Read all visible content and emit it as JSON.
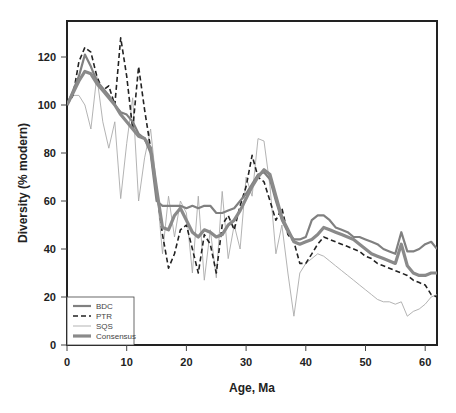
{
  "chart_data": {
    "type": "line",
    "title": "",
    "xlabel": "Age, Ma",
    "ylabel": "Diversity (% modern)",
    "xlim": [
      0,
      62
    ],
    "ylim": [
      0,
      135
    ],
    "xticks": [
      0,
      10,
      20,
      30,
      40,
      50,
      60
    ],
    "yticks": [
      0,
      20,
      40,
      60,
      80,
      100,
      120
    ],
    "grid": false,
    "legend_position": "lower left",
    "series": [
      {
        "name": "BDC",
        "style": "solid-medium",
        "color": "#808080",
        "x": [
          0,
          1,
          2,
          3,
          4,
          5,
          6,
          7,
          8,
          9,
          10,
          11,
          12,
          13,
          14,
          15,
          16,
          17,
          18,
          19,
          20,
          21,
          22,
          23,
          24,
          25,
          26,
          27,
          28,
          29,
          30,
          31,
          32,
          33,
          34,
          35,
          36,
          37,
          38,
          39,
          40,
          41,
          42,
          43,
          44,
          45,
          46,
          47,
          48,
          49,
          50,
          51,
          52,
          53,
          54,
          55,
          56,
          57,
          58,
          59,
          60,
          61,
          62
        ],
        "y": [
          100,
          106,
          112,
          121,
          116,
          110,
          107,
          104,
          100,
          97,
          96,
          93,
          88,
          86,
          80,
          60,
          58,
          58,
          58,
          58,
          57,
          58,
          57,
          58,
          58,
          55,
          55,
          56,
          57,
          60,
          63,
          67,
          71,
          72,
          69,
          60,
          52,
          47,
          44,
          44,
          45,
          52,
          54,
          54,
          52,
          49,
          48,
          47,
          45,
          45,
          44,
          43,
          42,
          40,
          39,
          38,
          47,
          39,
          39,
          40,
          42,
          43,
          40
        ]
      },
      {
        "name": "PTR",
        "style": "dashed",
        "color": "#222222",
        "x": [
          0,
          1,
          2,
          3,
          4,
          5,
          6,
          7,
          8,
          9,
          10,
          11,
          12,
          13,
          14,
          15,
          16,
          17,
          18,
          19,
          20,
          21,
          22,
          23,
          24,
          25,
          26,
          27,
          28,
          29,
          30,
          31,
          32,
          33,
          34,
          35,
          36,
          37,
          38,
          39,
          40,
          41,
          42,
          43,
          44,
          45,
          46,
          47,
          48,
          49,
          50,
          51,
          52,
          53,
          54,
          55,
          56,
          57,
          58,
          59,
          60,
          61,
          62
        ],
        "y": [
          100,
          104,
          118,
          124,
          122,
          112,
          106,
          108,
          100,
          128,
          112,
          90,
          116,
          98,
          82,
          65,
          46,
          32,
          38,
          48,
          50,
          40,
          30,
          46,
          42,
          30,
          50,
          54,
          48,
          58,
          66,
          79,
          70,
          68,
          60,
          52,
          57,
          46,
          43,
          34,
          34,
          38,
          42,
          45,
          44,
          43,
          42,
          41,
          40,
          39,
          37,
          36,
          34,
          33,
          32,
          31,
          30,
          29,
          27,
          26,
          25,
          21,
          20
        ]
      },
      {
        "name": "SQS",
        "style": "solid-thin",
        "color": "#aaaaaa",
        "x": [
          0,
          1,
          2,
          3,
          4,
          5,
          6,
          7,
          8,
          9,
          10,
          11,
          12,
          13,
          14,
          15,
          16,
          17,
          18,
          19,
          20,
          21,
          22,
          23,
          24,
          25,
          26,
          27,
          28,
          29,
          30,
          31,
          32,
          33,
          34,
          35,
          36,
          37,
          38,
          39,
          40,
          41,
          42,
          43,
          44,
          45,
          46,
          47,
          48,
          49,
          50,
          51,
          52,
          53,
          54,
          55,
          56,
          57,
          58,
          59,
          60,
          61,
          62
        ],
        "y": [
          100,
          104,
          104,
          100,
          90,
          112,
          93,
          82,
          93,
          61,
          84,
          103,
          60,
          78,
          90,
          66,
          38,
          62,
          45,
          60,
          55,
          30,
          62,
          27,
          48,
          28,
          64,
          36,
          50,
          40,
          70,
          62,
          86,
          85,
          66,
          38,
          50,
          30,
          12,
          30,
          34,
          36,
          38,
          37,
          35,
          33,
          31,
          29,
          27,
          25,
          23,
          21,
          19,
          18,
          18,
          17,
          18,
          12,
          14,
          15,
          17,
          20,
          21
        ]
      },
      {
        "name": "Consensus",
        "style": "solid-thick",
        "color": "#8a8a8a",
        "x": [
          0,
          1,
          2,
          3,
          4,
          5,
          6,
          7,
          8,
          9,
          10,
          11,
          12,
          13,
          14,
          15,
          16,
          17,
          18,
          19,
          20,
          21,
          22,
          23,
          24,
          25,
          26,
          27,
          28,
          29,
          30,
          31,
          32,
          33,
          34,
          35,
          36,
          37,
          38,
          39,
          40,
          41,
          42,
          43,
          44,
          45,
          46,
          47,
          48,
          49,
          50,
          51,
          52,
          53,
          54,
          55,
          56,
          57,
          58,
          59,
          60,
          61,
          62
        ],
        "y": [
          100,
          105,
          110,
          114,
          113,
          109,
          106,
          103,
          100,
          96,
          93,
          90,
          87,
          86,
          82,
          65,
          49,
          48,
          54,
          57,
          52,
          47,
          45,
          48,
          47,
          45,
          46,
          50,
          52,
          56,
          61,
          66,
          70,
          73,
          71,
          62,
          53,
          48,
          43,
          42,
          43,
          44,
          46,
          49,
          48,
          47,
          46,
          45,
          44,
          42,
          40,
          38,
          37,
          36,
          35,
          34,
          42,
          33,
          30,
          29,
          29,
          30,
          30
        ]
      }
    ]
  }
}
